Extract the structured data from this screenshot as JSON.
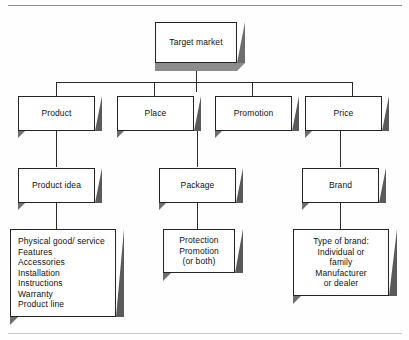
{
  "diagram": {
    "colors": {
      "box_face": "#ffffff",
      "box_outline": "#242424",
      "extrude_shadow": "#565656",
      "extrude_shadow_light": "#787878",
      "connector": "#2b2b2b",
      "page_rule": "#8f8f8f"
    },
    "levels": [
      {
        "name": "target-market",
        "nodes": [
          {
            "id": "target-market",
            "label": "Target market"
          }
        ]
      },
      {
        "name": "four-ps",
        "nodes": [
          {
            "id": "product",
            "label": "Product"
          },
          {
            "id": "place",
            "label": "Place"
          },
          {
            "id": "promotion",
            "label": "Promotion"
          },
          {
            "id": "price",
            "label": "Price"
          }
        ]
      },
      {
        "name": "product-subareas",
        "nodes": [
          {
            "id": "product-idea",
            "label": "Product idea"
          },
          {
            "id": "package",
            "label": "Package"
          },
          {
            "id": "brand",
            "label": "Brand"
          }
        ]
      },
      {
        "name": "details",
        "nodes": [
          {
            "id": "product-idea-details",
            "align": "left",
            "label": "Physical good/ service\nFeatures\nAccessories\nInstallation\nInstructions\nWarranty\nProduct line",
            "lines": [
              "Physical good/ service",
              "Features",
              "Accessories",
              "Installation",
              "Instructions",
              "Warranty",
              "Product line"
            ]
          },
          {
            "id": "package-details",
            "align": "center",
            "label": "Protection\nPromotion\n(or both)",
            "lines": [
              "Protection",
              "Promotion",
              "(or both)"
            ]
          },
          {
            "id": "brand-details",
            "align": "center",
            "label": "Type of brand:\nIndividual or\nfamily\nManufacturer\nor dealer",
            "lines": [
              "Type of brand:",
              "Individual or",
              "family",
              "Manufacturer",
              "or dealer"
            ]
          }
        ]
      }
    ]
  }
}
